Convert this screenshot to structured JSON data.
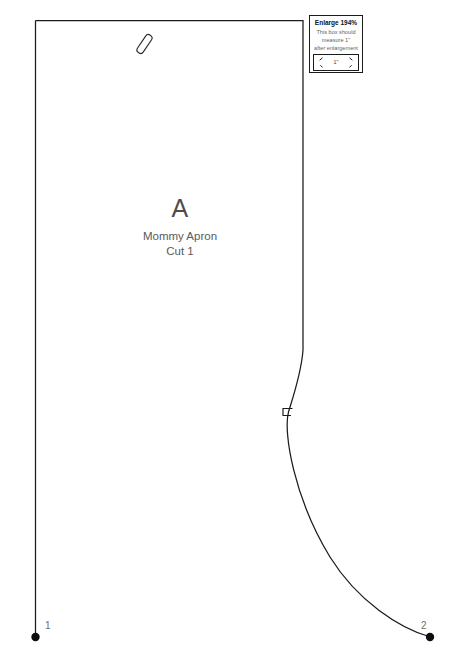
{
  "sheet": {
    "background_color": "#ffffff",
    "line_color": "#1b1b1b"
  },
  "piece": {
    "letter": "A",
    "name": "Mommy Apron",
    "cut_instruction": "Cut 1",
    "text_color": "#5a5a5a"
  },
  "markings": {
    "buttonhole_icon": "slanted-slit-mark",
    "notch_icon": "notch-tick-mark",
    "point_1": "1",
    "point_2": "2",
    "dot_color": "#0d0d0d"
  },
  "enlarge": {
    "title": "Enlarge 194%",
    "instruction_line_1": "This box should",
    "instruction_line_2": "measure 1\"",
    "instruction_line_3": "after enlargement",
    "measure_label": "1\"",
    "left_arrow_icon": "arrow-left-icon",
    "right_arrow_icon": "arrow-right-icon",
    "border_color": "#1b1b1b"
  }
}
